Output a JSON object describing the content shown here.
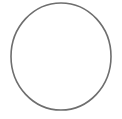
{
  "canvas": {
    "width": 122,
    "height": 119,
    "background_color": "#ffffff",
    "title": "Circle Outline"
  },
  "shape": {
    "name": "circle-outline",
    "type": "ellipse",
    "center_x": 61,
    "center_y": 56.5,
    "radius_x": 50,
    "radius_y": 53.5,
    "stroke_color": "#6e6e6e",
    "stroke_width": 1.6,
    "fill": "none",
    "label": "circle"
  }
}
